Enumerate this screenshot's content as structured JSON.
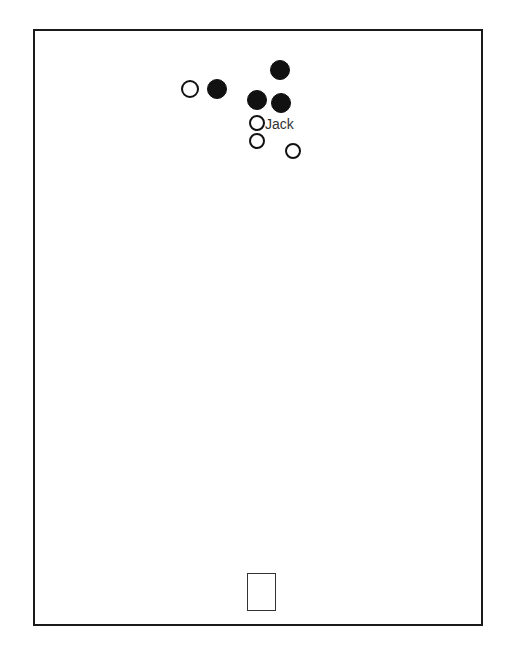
{
  "diagram": {
    "frame": {
      "left": 33,
      "top": 29,
      "right": 481,
      "bottom": 624,
      "color": "#1a1a1a"
    },
    "markers": [
      {
        "type": "open",
        "cx": 190,
        "cy": 89,
        "r": 9
      },
      {
        "type": "filled",
        "cx": 217,
        "cy": 89,
        "r": 10
      },
      {
        "type": "filled",
        "cx": 280,
        "cy": 70,
        "r": 10
      },
      {
        "type": "filled",
        "cx": 257,
        "cy": 100,
        "r": 10
      },
      {
        "type": "filled",
        "cx": 281,
        "cy": 103,
        "r": 10
      },
      {
        "type": "open",
        "cx": 257,
        "cy": 123,
        "r": 8
      },
      {
        "type": "open",
        "cx": 257,
        "cy": 141,
        "r": 8
      },
      {
        "type": "open",
        "cx": 293,
        "cy": 151,
        "r": 8
      }
    ],
    "labels": [
      {
        "text": "Jack",
        "x": 265,
        "y": 117
      }
    ],
    "goal": {
      "left": 247,
      "top": 573,
      "width": 29,
      "height": 38
    }
  }
}
